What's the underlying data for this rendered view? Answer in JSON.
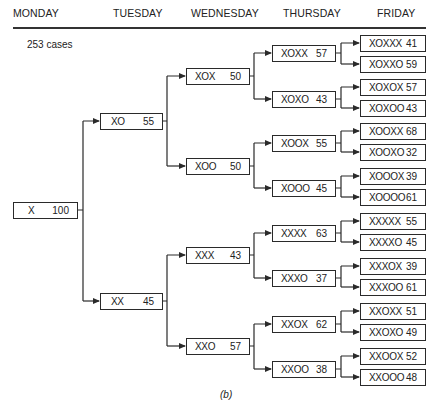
{
  "header": {
    "days": [
      "MONDAY",
      "TUESDAY",
      "WEDNESDAY",
      "THURSDAY",
      "FRIDAY"
    ]
  },
  "cases_label": "253 cases",
  "caption": "(b)",
  "tree": {
    "monday": [
      {
        "label": "X",
        "value": "100"
      }
    ],
    "tuesday": [
      {
        "label": "XO",
        "value": "55"
      },
      {
        "label": "XX",
        "value": "45"
      }
    ],
    "wednesday": [
      {
        "label": "XOX",
        "value": "50"
      },
      {
        "label": "XOO",
        "value": "50"
      },
      {
        "label": "XXX",
        "value": "43"
      },
      {
        "label": "XXO",
        "value": "57"
      }
    ],
    "thursday": [
      {
        "label": "XOXX",
        "value": "57"
      },
      {
        "label": "XOXO",
        "value": "43"
      },
      {
        "label": "XOOX",
        "value": "55"
      },
      {
        "label": "XOOO",
        "value": "45"
      },
      {
        "label": "XXXX",
        "value": "63"
      },
      {
        "label": "XXXO",
        "value": "37"
      },
      {
        "label": "XXOX",
        "value": "62"
      },
      {
        "label": "XXOO",
        "value": "38"
      }
    ],
    "friday": [
      {
        "label": "XOXXX",
        "value": "41"
      },
      {
        "label": "XOXXO",
        "value": "59"
      },
      {
        "label": "XOXOX",
        "value": "57"
      },
      {
        "label": "XOXOO",
        "value": "43"
      },
      {
        "label": "XOOXX",
        "value": "68"
      },
      {
        "label": "XOOXO",
        "value": "32"
      },
      {
        "label": "XOOOX",
        "value": "39"
      },
      {
        "label": "XOOOO",
        "value": "61"
      },
      {
        "label": "XXXXX",
        "value": "55"
      },
      {
        "label": "XXXXO",
        "value": "45"
      },
      {
        "label": "XXXOX",
        "value": "39"
      },
      {
        "label": "XXXOO",
        "value": "61"
      },
      {
        "label": "XXOXX",
        "value": "51"
      },
      {
        "label": "XXOXO",
        "value": "49"
      },
      {
        "label": "XXOOX",
        "value": "52"
      },
      {
        "label": "XXOOO",
        "value": "48"
      }
    ]
  }
}
